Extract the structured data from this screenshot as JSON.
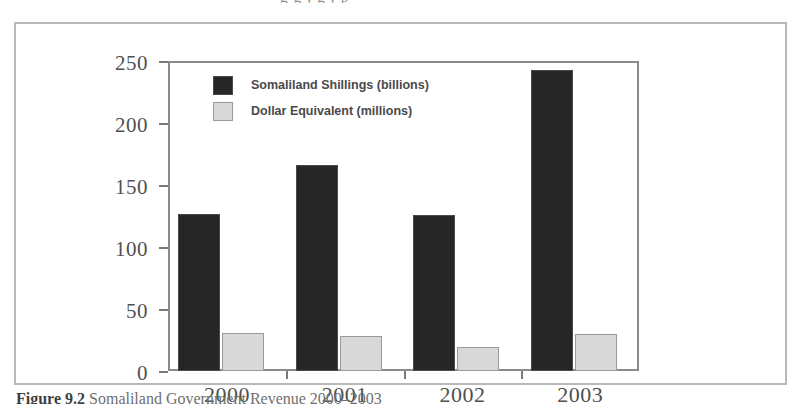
{
  "top_cut_text": "g g , g ,  p",
  "caption": {
    "label": "Figure 9.2",
    "text": "Somaliland Government Revenue 2000–2003"
  },
  "legend": {
    "items": [
      {
        "label": "Somaliland Shillings (billions)",
        "swatch": "dark-square-icon",
        "color": "#262626"
      },
      {
        "label": "Dollar Equivalent (millions)",
        "swatch": "light-square-icon",
        "color": "#d8d8d8"
      }
    ]
  },
  "axes": {
    "y_ticks": [
      "0",
      "50",
      "100",
      "150",
      "200",
      "250"
    ],
    "x_ticks": [
      "2000",
      "2001",
      "2002",
      "2003"
    ]
  },
  "chart_data": {
    "type": "bar",
    "title": "Somaliland Government Revenue 2000–2003",
    "xlabel": "",
    "ylabel": "",
    "ylim": [
      0,
      250
    ],
    "ytick_step": 50,
    "grid": false,
    "legend_position": "top-left-inside",
    "categories": [
      "2000",
      "2001",
      "2002",
      "2003"
    ],
    "series": [
      {
        "name": "Somaliland Shillings (billions)",
        "color": "#262626",
        "values": [
          127,
          166,
          126,
          243
        ]
      },
      {
        "name": "Dollar Equivalent (millions)",
        "color": "#d8d8d8",
        "values": [
          31,
          28,
          19,
          30
        ]
      }
    ]
  }
}
